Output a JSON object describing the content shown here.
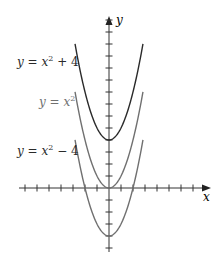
{
  "chart_data": {
    "type": "line",
    "title": "",
    "xlabel": "x",
    "ylabel": "y",
    "xlim": [
      -7.5,
      8.5
    ],
    "ylim": [
      -5.4,
      14.2
    ],
    "grid": false,
    "ticks": {
      "x_step": 1,
      "y_step": 1,
      "x_count_each_side": 7,
      "y_count_above": 14,
      "y_count_below": 5,
      "tick_labels": false
    },
    "legend_position": "inline-left",
    "series": [
      {
        "name": "y = x² + 4",
        "expr": "x^2 + 4",
        "shift": 4,
        "x_range": [
          -2.83,
          2.83
        ],
        "color": "#2a2a2a",
        "label_color": "#2a2a2a"
      },
      {
        "name": "y = x²",
        "expr": "x^2",
        "shift": 0,
        "x_range": [
          -2.83,
          2.83
        ],
        "color": "#707070",
        "label_color": "#707070"
      },
      {
        "name": "y = x² − 4",
        "expr": "x^2 - 4",
        "shift": -4,
        "x_range": [
          -2.83,
          2.83
        ],
        "color": "#707070",
        "label_color": "#2a2a2a"
      }
    ]
  },
  "labels": {
    "curve_top": {
      "y": "y",
      "eq": " = ",
      "x": "x",
      "sup": "2",
      "tail": " + 4"
    },
    "curve_mid": {
      "y": "y",
      "eq": " = ",
      "x": "x",
      "sup": "2",
      "tail": ""
    },
    "curve_bottom": {
      "y": "y",
      "eq": " = ",
      "x": "x",
      "sup": "2",
      "tail": " − 4"
    },
    "x_axis": "x",
    "y_axis": "y"
  }
}
